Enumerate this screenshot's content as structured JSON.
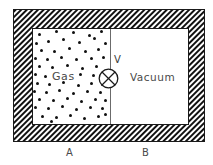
{
  "diagram": {
    "container": {
      "wall_style": "hatched",
      "wall_hatch_direction": "diagonal-45",
      "outer": {
        "x": 13,
        "y": 9,
        "width": 192,
        "height": 133
      },
      "cavity": {
        "x": 32,
        "y": 28,
        "width": 157,
        "height": 97
      },
      "border_color": "#1a1a1a",
      "hatch_color": "#111111",
      "fill_color": "#ffffff"
    },
    "partition": {
      "x": 110,
      "y_top": 29,
      "y_bottom": 124,
      "color": "#6b6b6b"
    },
    "valve": {
      "icon": "crossed-circle-valve-icon",
      "label": "V",
      "cx": 108.5,
      "cy": 78.5,
      "r": 9.5,
      "color": "#1a1a1a"
    },
    "chambers": [
      {
        "id": "A",
        "label": "Gas",
        "side_label": "A",
        "contents": "gas",
        "label_x": 52,
        "label_y": 70,
        "side_label_x": 66,
        "side_label_y": 147
      },
      {
        "id": "B",
        "label": "Vacuum",
        "side_label": "B",
        "contents": "vacuum",
        "label_x": 130,
        "label_y": 71,
        "side_label_x": 142,
        "side_label_y": 147
      }
    ],
    "gas_particles": {
      "count": 62,
      "dot_color": "#101010",
      "dot_size": 3,
      "points": [
        [
          38,
          33
        ],
        [
          55,
          30
        ],
        [
          72,
          31
        ],
        [
          88,
          34
        ],
        [
          100,
          30
        ],
        [
          35,
          42
        ],
        [
          47,
          40
        ],
        [
          62,
          38
        ],
        [
          78,
          41
        ],
        [
          93,
          37
        ],
        [
          104,
          42
        ],
        [
          40,
          49
        ],
        [
          53,
          50
        ],
        [
          68,
          47
        ],
        [
          84,
          50
        ],
        [
          97,
          48
        ],
        [
          34,
          57
        ],
        [
          46,
          58
        ],
        [
          60,
          56
        ],
        [
          75,
          58
        ],
        [
          90,
          57
        ],
        [
          102,
          56
        ],
        [
          38,
          65
        ],
        [
          51,
          66
        ],
        [
          66,
          64
        ],
        [
          81,
          67
        ],
        [
          95,
          65
        ],
        [
          34,
          73
        ],
        [
          44,
          75
        ],
        [
          79,
          73
        ],
        [
          92,
          74
        ],
        [
          103,
          72
        ],
        [
          36,
          82
        ],
        [
          48,
          83
        ],
        [
          62,
          81
        ],
        [
          77,
          84
        ],
        [
          90,
          82
        ],
        [
          101,
          83
        ],
        [
          33,
          90
        ],
        [
          45,
          91
        ],
        [
          58,
          89
        ],
        [
          72,
          92
        ],
        [
          86,
          90
        ],
        [
          99,
          91
        ],
        [
          38,
          98
        ],
        [
          52,
          99
        ],
        [
          66,
          97
        ],
        [
          80,
          100
        ],
        [
          94,
          98
        ],
        [
          104,
          99
        ],
        [
          34,
          106
        ],
        [
          47,
          107
        ],
        [
          61,
          105
        ],
        [
          75,
          108
        ],
        [
          89,
          106
        ],
        [
          101,
          107
        ],
        [
          41,
          115
        ],
        [
          55,
          116
        ],
        [
          69,
          114
        ],
        [
          83,
          117
        ],
        [
          97,
          115
        ],
        [
          104,
          113
        ],
        [
          50,
          120
        ]
      ]
    }
  }
}
